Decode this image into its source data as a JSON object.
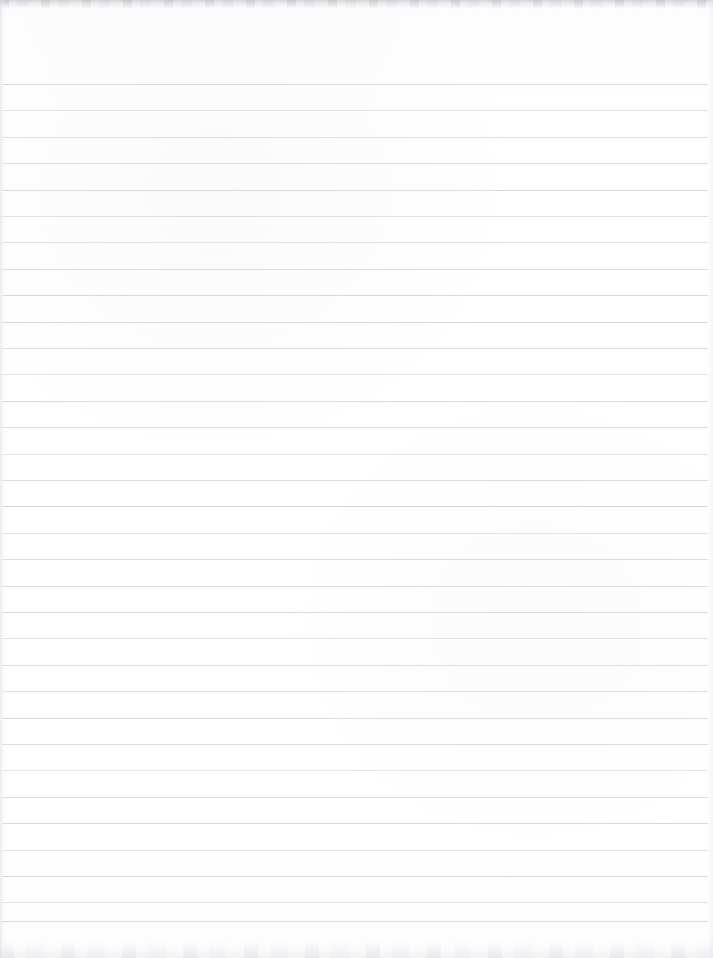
{
  "document": {
    "kind": "scanned-ruled-notebook-page",
    "title": "Blank Ruled Notebook Page",
    "page_width": 713,
    "page_height": 958,
    "background_color": "#fefeff",
    "is_blank": true,
    "written_text": ""
  },
  "ruling": {
    "line_color": "#d7dadd",
    "line_thickness": 1,
    "line_spacing": 26.4,
    "first_line_y": 84,
    "last_line_y": 921,
    "line_count": 33,
    "line_start_x": 2,
    "line_end_x": 708,
    "has_vertical_margin_rule": false,
    "y_positions": [
      84,
      110.4,
      136.8,
      163.2,
      189.6,
      216,
      242.4,
      268.8,
      295.2,
      321.6,
      348,
      374.4,
      400.8,
      427.2,
      453.6,
      480,
      506.4,
      532.8,
      559.2,
      585.6,
      612,
      638.4,
      664.8,
      691.2,
      717.6,
      744,
      770.4,
      796.8,
      823.2,
      849.6,
      876,
      902.4,
      921
    ]
  },
  "scan_artifacts": {
    "top_band_color": "#cdcfd4",
    "top_band_height": 9,
    "bottom_band_color": "#ecedf0",
    "bottom_band_height": 18,
    "left_edge_shadow_color": "#d6d8dc",
    "right_edge_shadow_color": "#e2e4e7"
  }
}
